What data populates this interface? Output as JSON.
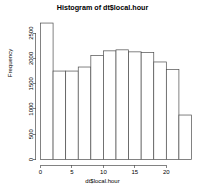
{
  "chart_data": {
    "type": "bar",
    "title": "Histogram of dt$local.hour",
    "xlabel": "dt$local.hour",
    "ylabel": "Frequency",
    "bin_width": 2,
    "bin_starts": [
      0,
      2,
      4,
      6,
      8,
      10,
      12,
      14,
      16,
      18,
      20,
      22
    ],
    "bin_ends": [
      2,
      4,
      6,
      8,
      10,
      12,
      14,
      16,
      18,
      20,
      22,
      24
    ],
    "categories": [
      "0-2",
      "2-4",
      "4-6",
      "6-8",
      "8-10",
      "10-12",
      "12-14",
      "14-16",
      "16-18",
      "18-20",
      "20-22",
      "22-24"
    ],
    "values": [
      2700,
      1750,
      1750,
      1830,
      2060,
      2150,
      2170,
      2130,
      2120,
      1930,
      1780,
      880
    ],
    "xlim": [
      0,
      24
    ],
    "ylim": [
      0,
      2800
    ],
    "xticks": [
      0,
      5,
      10,
      15,
      20
    ],
    "xtick_labels": [
      "0",
      "5",
      "10",
      "15",
      "20"
    ],
    "yticks": [
      0,
      500,
      1000,
      1500,
      2000,
      2500
    ],
    "ytick_labels": [
      "0",
      "500",
      "1000",
      "1500",
      "2000",
      "2500"
    ],
    "grid": false,
    "legend": false,
    "bar_fill_color": "#ffffff",
    "bar_border_color": "#4d4d4d",
    "axis_color": "#4d4d4d",
    "background_color": "#ffffff"
  }
}
